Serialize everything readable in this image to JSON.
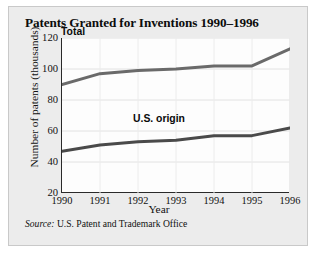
{
  "figure": {
    "title": "Patents Granted for Inventions 1990–1996",
    "source_key": "Source:",
    "source_text": "U.S. Patent and Trademark Office"
  },
  "chart_data": {
    "type": "line",
    "title": "Patents Granted for Inventions 1990–1996",
    "xlabel": "Year",
    "ylabel": "Number of patents (thousands)",
    "categories": [
      "1990",
      "1991",
      "1992",
      "1993",
      "1994",
      "1995",
      "1996"
    ],
    "x": [
      1990,
      1991,
      1992,
      1993,
      1994,
      1995,
      1996
    ],
    "xlim": [
      1990,
      1996
    ],
    "ylim": [
      20,
      120
    ],
    "yticks": [
      "20",
      "40",
      "60",
      "80",
      "100",
      "120"
    ],
    "ytick_values": [
      20,
      40,
      60,
      80,
      100,
      120
    ],
    "grid": true,
    "legend_position": "inline-annotations",
    "series": [
      {
        "name": "Total",
        "label": "Total",
        "color": "#6a6a6a",
        "values": [
          90,
          97,
          99,
          100,
          102,
          102,
          113
        ]
      },
      {
        "name": "U.S. origin",
        "label": "U.S. origin",
        "color": "#4a4a4a",
        "values": [
          47,
          51,
          53,
          54,
          57,
          57,
          62
        ]
      }
    ]
  }
}
